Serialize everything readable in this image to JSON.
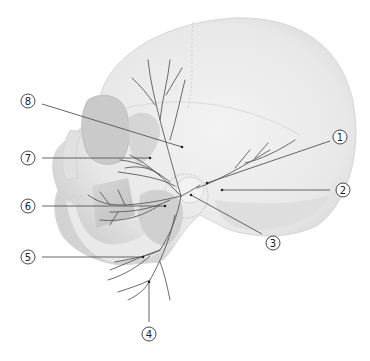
{
  "figure": {
    "colors": {
      "background": "#ffffff",
      "bone": "#e6e6e6",
      "bone_shadow": "#cfcfcf",
      "muscle": "#c8c8c8",
      "nerve": "#5a5a5a",
      "leader_line": "#555555",
      "label_circle": "#333333"
    }
  },
  "callouts": [
    {
      "id": 1,
      "label": "1",
      "cx": 340,
      "cy": 137,
      "line": [
        [
          330,
          141
        ],
        [
          207,
          183
        ]
      ]
    },
    {
      "id": 2,
      "label": "2",
      "cx": 343,
      "cy": 190,
      "line": [
        [
          330,
          190
        ],
        [
          222,
          190
        ]
      ]
    },
    {
      "id": 3,
      "label": "3",
      "cx": 273,
      "cy": 243,
      "line": [
        [
          262,
          234
        ],
        [
          191,
          195
        ]
      ]
    },
    {
      "id": 4,
      "label": "4",
      "cx": 149,
      "cy": 334,
      "line": [
        [
          149,
          322
        ],
        [
          149,
          282
        ]
      ]
    },
    {
      "id": 5,
      "label": "5",
      "cx": 28,
      "cy": 257,
      "line": [
        [
          42,
          257
        ],
        [
          143,
          257
        ]
      ]
    },
    {
      "id": 6,
      "label": "6",
      "cx": 28,
      "cy": 206,
      "line": [
        [
          42,
          206
        ],
        [
          165,
          206
        ]
      ]
    },
    {
      "id": 7,
      "label": "7",
      "cx": 28,
      "cy": 158,
      "line": [
        [
          42,
          158
        ],
        [
          150,
          158
        ]
      ]
    },
    {
      "id": 8,
      "label": "8",
      "cx": 28,
      "cy": 101,
      "line": [
        [
          42,
          104
        ],
        [
          182,
          147
        ]
      ]
    }
  ]
}
